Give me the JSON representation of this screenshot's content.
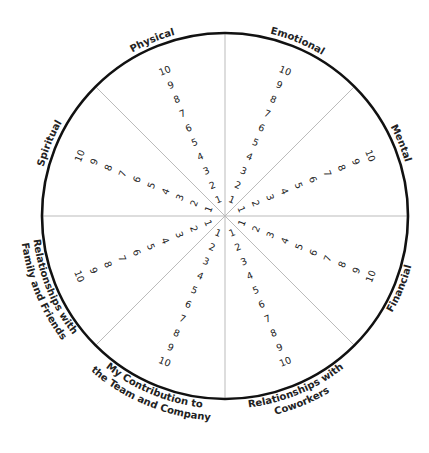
{
  "diagram": {
    "center": [
      225,
      216
    ],
    "radius": 183,
    "rim_color": "#111111",
    "spoke_color": "#bbbbbb",
    "scale": [
      "1",
      "2",
      "3",
      "4",
      "5",
      "6",
      "7",
      "8",
      "9",
      "10"
    ],
    "categories": [
      {
        "label": "Emotional",
        "lines": [
          "Emotional"
        ]
      },
      {
        "label": "Mental",
        "lines": [
          "Mental"
        ]
      },
      {
        "label": "Financial",
        "lines": [
          "Financial"
        ]
      },
      {
        "label": "Relationships with Coworkers",
        "lines": [
          "Relationships with",
          "Coworkers"
        ]
      },
      {
        "label": "My Contribution to the Team and Company",
        "lines": [
          "My Contribution to",
          "the Team and Company"
        ]
      },
      {
        "label": "Relationships with Family and Friends",
        "lines": [
          "Relationships with",
          "Family and Friends"
        ]
      },
      {
        "label": "Spiritual",
        "lines": [
          "Spiritual"
        ]
      },
      {
        "label": "Physical",
        "lines": [
          "Physical"
        ]
      }
    ]
  }
}
